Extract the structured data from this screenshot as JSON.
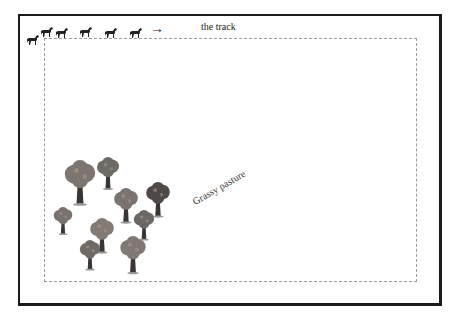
{
  "diagram": {
    "track_label": "the track",
    "pasture_label": "Grassy pasture",
    "arrow_icon": "→",
    "horses": [
      {
        "x": 26,
        "y": 32
      },
      {
        "x": 40,
        "y": 24
      },
      {
        "x": 55,
        "y": 25
      },
      {
        "x": 79,
        "y": 24
      },
      {
        "x": 104,
        "y": 25
      },
      {
        "x": 129,
        "y": 25
      }
    ],
    "trees": [
      {
        "x": 62,
        "y": 160,
        "s": 36,
        "c": "#7d7570"
      },
      {
        "x": 95,
        "y": 157,
        "s": 26,
        "c": "#6e6a66"
      },
      {
        "x": 112,
        "y": 188,
        "s": 28,
        "c": "#7b7370"
      },
      {
        "x": 144,
        "y": 182,
        "s": 28,
        "c": "#4f4a48"
      },
      {
        "x": 52,
        "y": 207,
        "s": 22,
        "c": "#7a726e"
      },
      {
        "x": 88,
        "y": 218,
        "s": 28,
        "c": "#847a74"
      },
      {
        "x": 132,
        "y": 210,
        "s": 24,
        "c": "#6d6764"
      },
      {
        "x": 78,
        "y": 240,
        "s": 24,
        "c": "#706a66"
      },
      {
        "x": 118,
        "y": 236,
        "s": 30,
        "c": "#807874"
      }
    ]
  }
}
